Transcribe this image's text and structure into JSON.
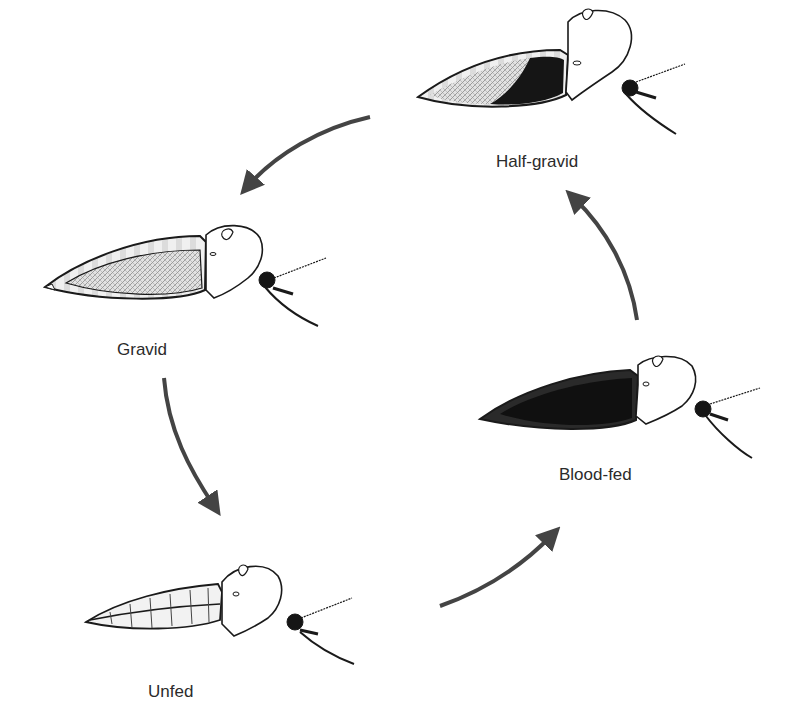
{
  "diagram": {
    "type": "cycle",
    "colors": {
      "ink": "#1a1a1a",
      "arrow": "#444444",
      "blood": "#151515",
      "eggs": "#c8c8c8",
      "background": "#ffffff"
    },
    "stages": [
      {
        "id": "half-gravid",
        "label": "Half-gravid",
        "abdomen": "half dark, half egg-filled"
      },
      {
        "id": "gravid",
        "label": "Gravid",
        "abdomen": "egg-filled (stippled)"
      },
      {
        "id": "unfed",
        "label": "Unfed",
        "abdomen": "empty, segmented"
      },
      {
        "id": "blood-fed",
        "label": "Blood-fed",
        "abdomen": "fully dark"
      }
    ],
    "arrows": [
      {
        "from": "half-gravid",
        "to": "gravid"
      },
      {
        "from": "gravid",
        "to": "unfed"
      },
      {
        "from": "unfed",
        "to": "blood-fed"
      },
      {
        "from": "blood-fed",
        "to": "half-gravid"
      }
    ]
  }
}
